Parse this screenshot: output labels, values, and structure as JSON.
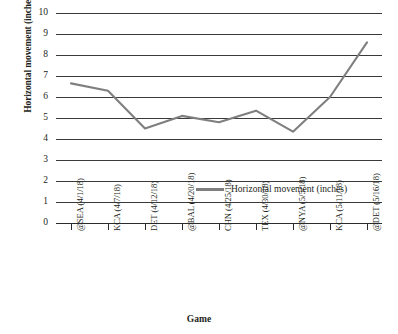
{
  "chart_data": {
    "type": "line",
    "title": "",
    "xlabel": "Game",
    "ylabel": "Horizontal movement (inches)",
    "ylim": [
      0,
      10
    ],
    "yticks": [
      10,
      9,
      8,
      7,
      6,
      5,
      4,
      3,
      2,
      1,
      0
    ],
    "grid": true,
    "legend_position": "inside-center-right",
    "categories": [
      "@SEA (4/1/18)",
      "KCA (4/7/18)",
      "DET (4/12/18)",
      "@BAL (4/20/18)",
      "CHN (4/25/18)",
      "TEX (4/30/18)",
      "@NYA (5/5/18)",
      "KCA (5/11/18)",
      "@DET (5/16/18)"
    ],
    "series": [
      {
        "name": "Horizontal movement (inches)",
        "color": "#7f7f7f",
        "values": [
          6.65,
          6.3,
          4.5,
          5.1,
          4.8,
          5.35,
          4.35,
          6.0,
          8.6
        ]
      }
    ]
  },
  "legend": {
    "entries": [
      {
        "label": "Horizontal movement (inches)",
        "color": "#7f7f7f"
      }
    ]
  },
  "colors": {
    "series": "#7f7f7f",
    "axis": "#2b2b2b",
    "grid": "#3a3a3a",
    "text": "#231f20",
    "background": "#ffffff"
  }
}
